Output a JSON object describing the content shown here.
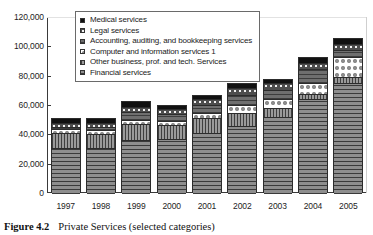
{
  "caption": {
    "figure_number": "Figure 4.2",
    "title": "Private Services (selected categories)"
  },
  "legend": {
    "position": "top-center-inside",
    "items": [
      {
        "label": "Medical services",
        "key": "medical",
        "swatch": "solid-black-square"
      },
      {
        "label": "Legal services",
        "key": "legal",
        "swatch": "dotted-gray-square"
      },
      {
        "label": "Accounting, auditing, and bookkeeping services",
        "key": "accounting",
        "swatch": "horizontal-hatch-square"
      },
      {
        "label": "Computer and information services 1",
        "key": "computer",
        "swatch": "white-dotted-square"
      },
      {
        "label": "Other business, prof. and tech. Services",
        "key": "other_business",
        "swatch": "vertical-hatch-square"
      },
      {
        "label": "Financial services",
        "key": "financial",
        "swatch": "gray-hatch-square"
      }
    ]
  },
  "axes": {
    "y_ticks": [
      "120,000",
      "100,000",
      "80,000",
      "60,000",
      "40,000",
      "20,000",
      "0"
    ],
    "y_tick_values": [
      120000,
      100000,
      80000,
      60000,
      40000,
      20000,
      0
    ],
    "x_ticks": [
      "1997",
      "1998",
      "1999",
      "2000",
      "2001",
      "2002",
      "2003",
      "2004",
      "2005"
    ]
  },
  "colors": {
    "medical": "#111111",
    "legal": "#4d4d4d",
    "accounting": "#6f6f6f",
    "computer": "#ffffff",
    "other_business": "#9a9a9a",
    "financial": "#8e8e8e",
    "axis": "#3a3a3a",
    "background": "#ffffff"
  },
  "chart_data": {
    "type": "bar",
    "stacked": true,
    "title": "Private Services (selected categories)",
    "xlabel": "",
    "ylabel": "",
    "ylim": [
      0,
      120000
    ],
    "ytick_step": 20000,
    "grid": false,
    "legend_position": "upper center",
    "categories": [
      "1997",
      "1998",
      "1999",
      "2000",
      "2001",
      "2002",
      "2003",
      "2004",
      "2005"
    ],
    "series": [
      {
        "name": "Financial services",
        "values": [
          31500,
          31500,
          37000,
          37500,
          41500,
          46500,
          52500,
          65000,
          76000
        ]
      },
      {
        "name": "Other business, prof. and tech. Services",
        "values": [
          10000,
          9500,
          10500,
          9500,
          10500,
          9000,
          6000,
          3500,
          3500
        ]
      },
      {
        "name": "Computer and information services 1",
        "values": [
          2500,
          2500,
          3000,
          3000,
          3500,
          5000,
          6000,
          7500,
          14000
        ]
      },
      {
        "name": "Accounting, auditing, and bookkeeping services",
        "values": [
          2000,
          2500,
          5500,
          4500,
          5500,
          7000,
          6500,
          9500,
          5000
        ]
      },
      {
        "name": "Legal services",
        "values": [
          2500,
          2500,
          3500,
          3500,
          3500,
          4500,
          4500,
          4000,
          4000
        ]
      },
      {
        "name": "Medical services",
        "values": [
          2500,
          2500,
          3500,
          2000,
          2500,
          3000,
          2500,
          3000,
          3500
        ]
      }
    ],
    "totals": [
      51000,
      51000,
      63000,
      60000,
      67000,
      75000,
      78000,
      92500,
      106000
    ]
  }
}
